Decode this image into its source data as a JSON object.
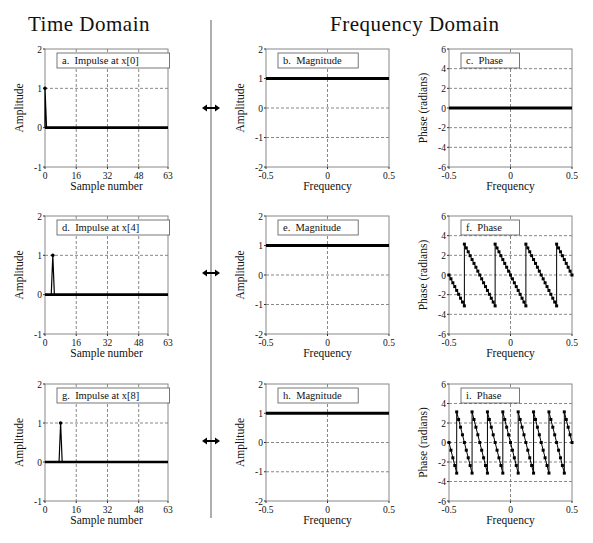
{
  "headers": {
    "time": "Time Domain",
    "frequency": "Frequency Domain"
  },
  "colors": {
    "line": "#000000",
    "grid": "#555555",
    "frame": "#888888",
    "divider": "#777777"
  },
  "chart_data": [
    {
      "id": "a",
      "type": "line",
      "label": "a.  Impulse at x[0]",
      "xlabel": "Sample number",
      "ylabel": "Amplitude",
      "xlim": [
        0,
        63
      ],
      "ylim": [
        -1,
        2
      ],
      "xticks": [
        0,
        16,
        32,
        48,
        63
      ],
      "yticks": [
        -1,
        0,
        1,
        2
      ],
      "series": [
        {
          "name": "x[n]",
          "impulse_at": 4,
          "impulse_index": 0,
          "values_desc": "1 at n=0, 0 elsewhere (n=0..63)"
        }
      ]
    },
    {
      "id": "b",
      "type": "line",
      "label": "b.  Magnitude",
      "xlabel": "Frequency",
      "ylabel": "Amplitude",
      "xlim": [
        -0.5,
        0.5
      ],
      "ylim": [
        -2,
        2
      ],
      "xticks": [
        -0.5,
        0,
        0.5
      ],
      "yticks": [
        -2,
        -1,
        0,
        1,
        2
      ],
      "series": [
        {
          "name": "magnitude",
          "x": [
            -0.5,
            0.5
          ],
          "y": [
            1,
            1
          ]
        }
      ]
    },
    {
      "id": "c",
      "type": "line",
      "label": "c.  Phase",
      "xlabel": "Frequency",
      "ylabel": "Phase (radians)",
      "xlim": [
        -0.5,
        0.5
      ],
      "ylim": [
        -6,
        6
      ],
      "xticks": [
        -0.5,
        0,
        0.5
      ],
      "yticks": [
        -6,
        -4,
        -2,
        0,
        2,
        4,
        6
      ],
      "series": [
        {
          "name": "phase",
          "x": [
            -0.5,
            0.5
          ],
          "y": [
            0,
            0
          ]
        }
      ]
    },
    {
      "id": "d",
      "type": "line",
      "label": "d.  Impulse at x[4]",
      "xlabel": "Sample number",
      "ylabel": "Amplitude",
      "xlim": [
        0,
        63
      ],
      "ylim": [
        -1,
        2
      ],
      "xticks": [
        0,
        16,
        32,
        48,
        63
      ],
      "yticks": [
        -1,
        0,
        1,
        2
      ],
      "series": [
        {
          "name": "x[n]",
          "impulse_index": 4,
          "values_desc": "1 at n=4, 0 elsewhere (n=0..63)"
        }
      ]
    },
    {
      "id": "e",
      "type": "line",
      "label": "e.  Magnitude",
      "xlabel": "Frequency",
      "ylabel": "Amplitude",
      "xlim": [
        -0.5,
        0.5
      ],
      "ylim": [
        -2,
        2
      ],
      "xticks": [
        -0.5,
        0,
        0.5
      ],
      "yticks": [
        -2,
        -1,
        0,
        1,
        2
      ],
      "series": [
        {
          "name": "magnitude",
          "x": [
            -0.5,
            0.5
          ],
          "y": [
            1,
            1
          ]
        }
      ]
    },
    {
      "id": "f",
      "type": "line",
      "label": "f.  Phase",
      "xlabel": "Frequency",
      "ylabel": "Phase (radians)",
      "xlim": [
        -0.5,
        0.5
      ],
      "ylim": [
        -6,
        6
      ],
      "xticks": [
        -0.5,
        0,
        0.5
      ],
      "yticks": [
        -6,
        -4,
        -2,
        0,
        2,
        4,
        6
      ],
      "series": [
        {
          "name": "phase",
          "x_start": -0.5,
          "x_step": 0.015625,
          "markers": true,
          "y": [
            0,
            -0.39,
            -0.79,
            -1.18,
            -1.57,
            -1.96,
            -2.36,
            -2.75,
            -3.14,
            2.75,
            2.36,
            1.96,
            1.57,
            1.18,
            0.79,
            0.39,
            0,
            -0.39,
            -0.79,
            -1.18,
            -1.57,
            -1.96,
            -2.36,
            -2.75,
            -3.14,
            2.75,
            2.36,
            1.96,
            1.57,
            1.18,
            0.79,
            0.39,
            0,
            -0.39,
            -0.79,
            -1.18,
            -1.57,
            -1.96,
            -2.36,
            -2.75,
            -3.14,
            2.75,
            2.36,
            1.96,
            1.57,
            1.18,
            0.79,
            0.39,
            0,
            -0.39,
            -0.79,
            -1.18,
            -1.57,
            -1.96,
            -2.36,
            -2.75,
            -3.14,
            2.75,
            2.36,
            1.96,
            1.57,
            1.18,
            0.79,
            0.39,
            0
          ]
        }
      ]
    },
    {
      "id": "g",
      "type": "line",
      "label": "g.  Impulse at x[8]",
      "xlabel": "Sample number",
      "ylabel": "Amplitude",
      "xlim": [
        0,
        63
      ],
      "ylim": [
        -1,
        2
      ],
      "xticks": [
        0,
        16,
        32,
        48,
        63
      ],
      "yticks": [
        -1,
        0,
        1,
        2
      ],
      "series": [
        {
          "name": "x[n]",
          "impulse_index": 8,
          "values_desc": "1 at n=8, 0 elsewhere (n=0..63)"
        }
      ]
    },
    {
      "id": "h",
      "type": "line",
      "label": "h.  Magnitude",
      "xlabel": "Frequency",
      "ylabel": "Amplitude",
      "xlim": [
        -0.5,
        0.5
      ],
      "ylim": [
        -2,
        2
      ],
      "xticks": [
        -0.5,
        0,
        0.5
      ],
      "yticks": [
        -2,
        -1,
        0,
        1,
        2
      ],
      "series": [
        {
          "name": "magnitude",
          "x": [
            -0.5,
            0.5
          ],
          "y": [
            1,
            1
          ]
        }
      ]
    },
    {
      "id": "i",
      "type": "line",
      "label": "i.  Phase",
      "xlabel": "Frequency",
      "ylabel": "Phase (radians)",
      "xlim": [
        -0.5,
        0.5
      ],
      "ylim": [
        -6,
        6
      ],
      "xticks": [
        -0.5,
        0,
        0.5
      ],
      "yticks": [
        -6,
        -4,
        -2,
        0,
        2,
        4,
        6
      ],
      "series": [
        {
          "name": "phase",
          "x_start": -0.5,
          "x_step": 0.015625,
          "markers": true,
          "y": [
            0,
            -0.79,
            -1.57,
            -2.36,
            -3.14,
            2.36,
            1.57,
            0.79,
            0,
            -0.79,
            -1.57,
            -2.36,
            -3.14,
            2.36,
            1.57,
            0.79,
            0,
            -0.79,
            -1.57,
            -2.36,
            -3.14,
            2.36,
            1.57,
            0.79,
            0,
            -0.79,
            -1.57,
            -2.36,
            -3.14,
            2.36,
            1.57,
            0.79,
            0,
            -0.79,
            -1.57,
            -2.36,
            -3.14,
            2.36,
            1.57,
            0.79,
            0,
            -0.79,
            -1.57,
            -2.36,
            -3.14,
            2.36,
            1.57,
            0.79,
            0,
            -0.79,
            -1.57,
            -2.36,
            -3.14,
            2.36,
            1.57,
            0.79,
            0,
            -0.79,
            -1.57,
            -2.36,
            -3.14,
            2.36,
            1.57,
            0.79,
            0
          ]
        }
      ]
    }
  ]
}
